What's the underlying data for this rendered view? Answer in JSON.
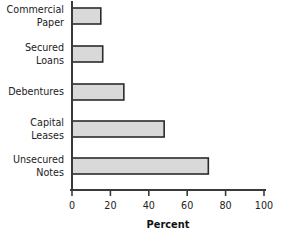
{
  "chart_data": {
    "type": "bar",
    "orientation": "horizontal",
    "title": "",
    "xlabel": "Percent",
    "ylabel": "",
    "categories": [
      "Commercial Paper",
      "Secured Loans",
      "Debentures",
      "Capital Leases",
      "Unsecured Notes"
    ],
    "category_lines": [
      [
        "Commercial",
        "Paper"
      ],
      [
        "Secured",
        "Loans"
      ],
      [
        "Debentures"
      ],
      [
        "Capital",
        "Leases"
      ],
      [
        "Unsecured",
        "Notes"
      ]
    ],
    "values": [
      15,
      16,
      27,
      48,
      71
    ],
    "xlim": [
      0,
      100
    ],
    "xticks": [
      0,
      20,
      40,
      60,
      80,
      100
    ],
    "xtick_labels": [
      "0",
      "20",
      "40",
      "60",
      "80",
      "100"
    ],
    "grid": false,
    "legend": false,
    "bar_fill": "#d9d9d9",
    "bar_stroke": "#2b2b2b",
    "axis_color": "#3a3a3a",
    "background": "#ffffff"
  }
}
